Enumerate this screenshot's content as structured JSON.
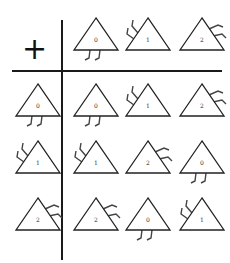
{
  "operator": "+",
  "elements": [
    "0",
    "1",
    "2"
  ],
  "legs_style": {
    "0": "two legs pointing down from base",
    "1": "two legs from upper-left side",
    "2": "two legs from right side"
  },
  "header_row": [
    "0",
    "1",
    "2"
  ],
  "header_col": [
    "0",
    "1",
    "2"
  ],
  "table": [
    [
      "0",
      "1",
      "2"
    ],
    [
      "1",
      "2",
      "0"
    ],
    [
      "2",
      "0",
      "1"
    ]
  ],
  "colors": {
    "line": "#1a1a1a",
    "background": "#ffffff"
  }
}
